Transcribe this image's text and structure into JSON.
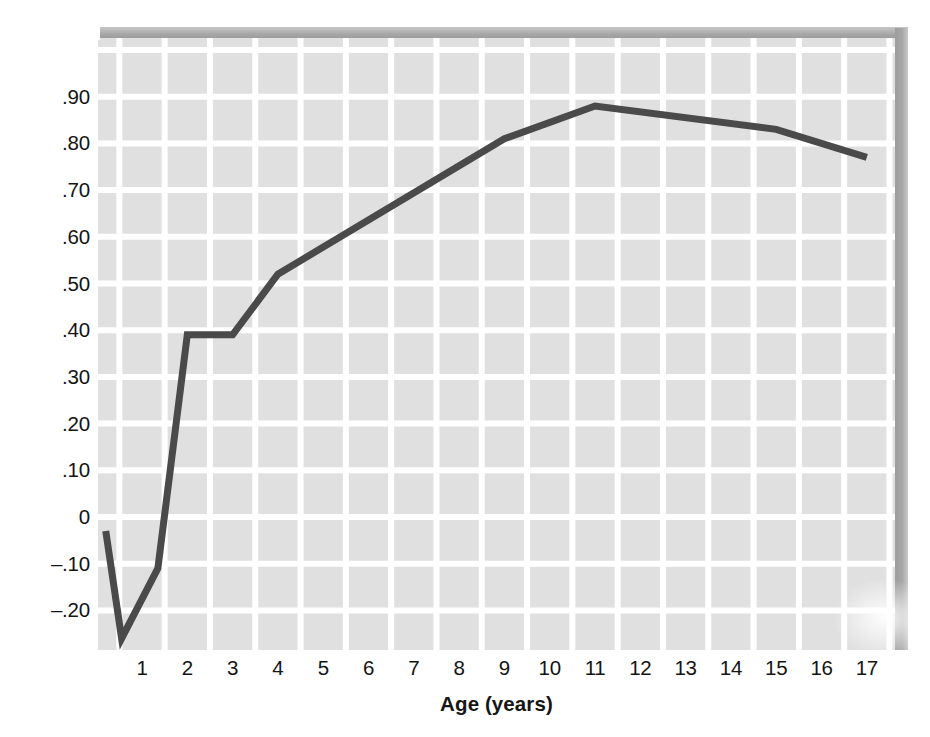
{
  "figure": {
    "title": "",
    "y_axis_title_prefix": "Correlation with IQ at 18 years (",
    "y_axis_title_italic": "r",
    "y_axis_title_suffix": ")",
    "x_axis_title": "Age (years)",
    "line_color": "#4a4a4a",
    "plot_background": "#e0e0e0",
    "gridline_color": "#ffffff",
    "text_color": "#141414"
  },
  "chart_data": {
    "type": "line",
    "title": "",
    "xlabel": "Age (years)",
    "ylabel": "Correlation with IQ at 18 years (r)",
    "xlim": [
      0.0,
      17.6
    ],
    "ylim": [
      -0.31,
      1.0
    ],
    "grid": true,
    "legend": false,
    "xticks": [
      1,
      2,
      3,
      4,
      5,
      6,
      7,
      8,
      9,
      10,
      11,
      12,
      13,
      14,
      15,
      16,
      17
    ],
    "xticklabels": [
      "1",
      "2",
      "3",
      "4",
      "5",
      "6",
      "7",
      "8",
      "9",
      "10",
      "11",
      "12",
      "13",
      "14",
      "15",
      "16",
      "17"
    ],
    "yticks": [
      0.9,
      0.8,
      0.7,
      0.6,
      0.5,
      0.4,
      0.3,
      0.2,
      0.1,
      0.0,
      -0.1,
      -0.2
    ],
    "yticklabels": [
      ".90",
      ".80",
      ".70",
      ".60",
      ".50",
      ".40",
      ".30",
      ".20",
      ".10",
      "0",
      "–.10",
      "–.20"
    ],
    "series": [
      {
        "name": "Correlation with IQ at 18 years",
        "x": [
          0.2,
          0.55,
          1.35,
          2.0,
          3.0,
          4.0,
          9.0,
          11.0,
          15.0,
          17.0
        ],
        "y": [
          -0.03,
          -0.26,
          -0.11,
          0.39,
          0.39,
          0.52,
          0.81,
          0.88,
          0.83,
          0.77
        ]
      }
    ]
  }
}
